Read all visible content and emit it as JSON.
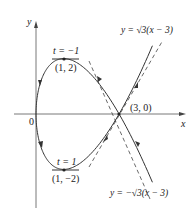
{
  "figure": {
    "axes": {
      "x_label": "x",
      "y_label": "y",
      "origin_label": "0"
    },
    "curve": {
      "x_of_t": "t^2",
      "y_of_t": "t^3 - 3t",
      "t_range": [
        -2.05,
        2.05
      ]
    },
    "tangent_lines": [
      {
        "label": "y = √3(x − 3)",
        "slope": 1.732
      },
      {
        "label": "y = −√3(x − 3)",
        "slope": -1.732
      }
    ],
    "points": [
      {
        "label": "(1, 2)",
        "param": "t = −1",
        "x": 1,
        "y": 2
      },
      {
        "label": "(1, −2)",
        "param": "t = 1",
        "x": 1,
        "y": -2
      },
      {
        "label": "(3, 0)",
        "x": 3,
        "y": 0
      }
    ],
    "colors": {
      "curve": "#333333",
      "axes": "#444444"
    }
  }
}
